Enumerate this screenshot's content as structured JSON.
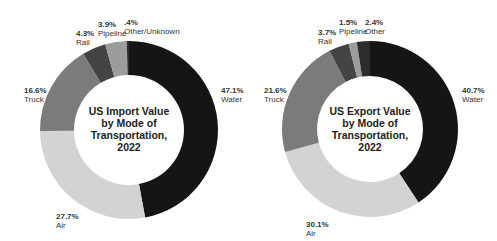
{
  "chart_data": [
    {
      "type": "pie",
      "title": "US Import Value by Mode of Transportation, 2022",
      "title_lines": [
        "US Import Value",
        "by Mode of",
        "Transportation,",
        "2022"
      ],
      "categories": [
        "Water",
        "Air",
        "Truck",
        "Rail",
        "Pipeline",
        "Other/Unknown"
      ],
      "values": [
        47.1,
        27.7,
        16.6,
        4.3,
        3.9,
        0.4
      ],
      "labels": [
        "47.1%",
        "27.7%",
        "16.6%",
        "4.3%",
        "3.9%",
        ".4%"
      ],
      "colors": [
        "#151515",
        "#d3d3d3",
        "#7b7b7b",
        "#444444",
        "#9c9c9c",
        "#2c2c2c"
      ],
      "donut": true,
      "legend": "none (direct labels)"
    },
    {
      "type": "pie",
      "title": "US Export Value by Mode of Transportation, 2022",
      "title_lines": [
        "US Export Value",
        "by Mode of",
        "Transportation,",
        "2022"
      ],
      "categories": [
        "Water",
        "Air",
        "Truck",
        "Rail",
        "Pipeline",
        "Other"
      ],
      "values": [
        40.7,
        30.1,
        21.6,
        3.7,
        1.5,
        2.4
      ],
      "labels": [
        "40.7%",
        "30.1%",
        "21.6%",
        "3.7%",
        "1.5%",
        "2.4%"
      ],
      "colors": [
        "#151515",
        "#d3d3d3",
        "#7b7b7b",
        "#444444",
        "#9c9c9c",
        "#2c2c2c"
      ],
      "donut": true,
      "legend": "none (direct labels)"
    }
  ]
}
